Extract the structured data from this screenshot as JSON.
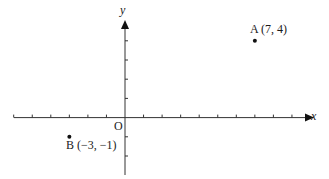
{
  "diagram": {
    "type": "coordinate-plane",
    "axes": {
      "x_label": "x",
      "y_label": "y",
      "origin_label": "O",
      "x_ticks_min": -6,
      "x_ticks_max": 9,
      "y_ticks_min": -2,
      "y_ticks_max": 4
    },
    "points": [
      {
        "name": "A",
        "x": 7,
        "y": 4,
        "label": "A (7, 4)"
      },
      {
        "name": "B",
        "x": -3,
        "y": -1,
        "label": "B (−3, −1)"
      }
    ],
    "colors": {
      "ink": "#1a1a1a",
      "axis": "#333333",
      "background": "#ffffff"
    }
  },
  "chart_data": {
    "type": "scatter",
    "title": "",
    "xlabel": "x",
    "ylabel": "y",
    "xlim": [
      -6,
      10
    ],
    "ylim": [
      -3,
      5
    ],
    "grid": false,
    "series": [
      {
        "name": "points",
        "points": [
          {
            "label": "A",
            "x": 7,
            "y": 4
          },
          {
            "label": "B",
            "x": -3,
            "y": -1
          }
        ]
      }
    ],
    "annotations": [
      "A (7, 4)",
      "B (−3, −1)",
      "O"
    ]
  }
}
